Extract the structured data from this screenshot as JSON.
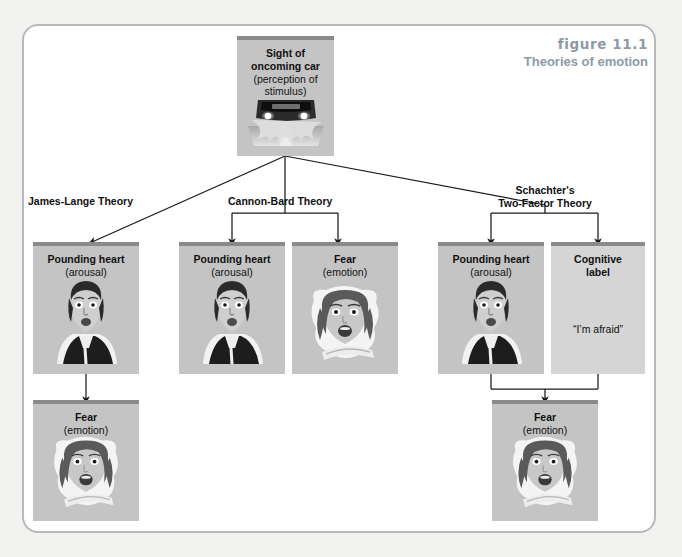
{
  "caption": {
    "figure_label": "figure 11.1",
    "title": "Theories of emotion"
  },
  "colors": {
    "page_background": "#f2f2f0",
    "frame_background": "#ffffff",
    "frame_border": "#b9b9b9",
    "box_fill": "#c4c4c4",
    "box_fill_light": "#d5d5d5",
    "box_header_bar": "#8a8a8a",
    "caption_text": "#8d9aa6",
    "body_text": "#111111",
    "connector": "#1a1a1a"
  },
  "stimulus": {
    "title": "Sight of oncoming car",
    "subtitle": "(perception of stimulus)",
    "image": "oncoming-car-at-night-photo"
  },
  "theories": [
    {
      "id": "james-lange",
      "label": "James-Lange Theory",
      "label_lines": [
        "James-Lange Theory"
      ]
    },
    {
      "id": "cannon-bard",
      "label": "Cannon-Bard Theory",
      "label_lines": [
        "Cannon-Bard Theory"
      ]
    },
    {
      "id": "schachter",
      "label": "Schachter's Two-Factor Theory",
      "label_lines": [
        "Schachter's",
        "Two-Factor Theory"
      ]
    }
  ],
  "nodes": [
    {
      "id": "jl-arousal",
      "theory": "james-lange",
      "row": "middle",
      "title": "Pounding heart",
      "subtitle": "(arousal)",
      "image": "startled-face-pounding-heart-photo"
    },
    {
      "id": "cb-arousal",
      "theory": "cannon-bard",
      "row": "middle",
      "title": "Pounding heart",
      "subtitle": "(arousal)",
      "image": "startled-face-pounding-heart-photo"
    },
    {
      "id": "cb-fear",
      "theory": "cannon-bard",
      "row": "middle",
      "title": "Fear",
      "subtitle": "(emotion)",
      "image": "screaming-driver-face-photo"
    },
    {
      "id": "sc-arousal",
      "theory": "schachter",
      "row": "middle",
      "title": "Pounding heart",
      "subtitle": "(arousal)",
      "image": "startled-face-pounding-heart-photo"
    },
    {
      "id": "sc-label",
      "theory": "schachter",
      "row": "middle",
      "title": "Cognitive label",
      "subtitle": "",
      "quote": "“I’m afraid”",
      "image": ""
    },
    {
      "id": "jl-fear",
      "theory": "james-lange",
      "row": "bottom",
      "title": "Fear",
      "subtitle": "(emotion)",
      "image": "screaming-driver-face-photo"
    },
    {
      "id": "sc-fear",
      "theory": "schachter",
      "row": "bottom",
      "title": "Fear",
      "subtitle": "(emotion)",
      "image": "screaming-driver-face-photo"
    }
  ],
  "node_titles": {
    "pounding_heart": "Pounding heart",
    "arousal": "(arousal)",
    "fear": "Fear",
    "emotion": "(emotion)",
    "cognitive_label_line1": "Cognitive",
    "cognitive_label_line2": "label",
    "cognitive_quote": "“I’m afraid”"
  },
  "flow": {
    "description": "Stimulus branches to three theories; James-Lange is arousal then emotion in sequence; Cannon-Bard is arousal and emotion simultaneously; Schachter's combines arousal plus cognitive label to produce emotion."
  }
}
